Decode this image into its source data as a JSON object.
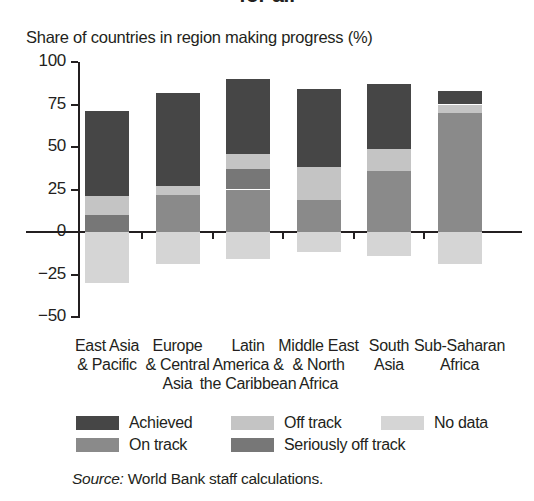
{
  "heading_clipped": "for all",
  "source": {
    "lead": "Source:",
    "text": " World Bank staff calculations."
  },
  "chart_data": {
    "type": "bar",
    "subtype": "stacked-bar-diverging",
    "title": "Share of countries in region making progress (%)",
    "ylabel": "Share of countries in region making progress (%)",
    "xlabel": "",
    "ylim": [
      -50,
      100
    ],
    "yticks": [
      100,
      75,
      50,
      25,
      0,
      -25,
      -50
    ],
    "ytick_labels": [
      "100",
      "75",
      "50",
      "25",
      "0",
      "−25",
      "−50"
    ],
    "grid": false,
    "legend_position": "bottom",
    "categories": [
      "East Asia & Pacific",
      "Europe & Central Asia",
      "Latin America & the Caribbean",
      "Middle East & North Africa",
      "South Asia",
      "Sub-Saharan Africa"
    ],
    "category_lines": [
      [
        "East Asia",
        "& Pacific"
      ],
      [
        "Europe",
        "& Central",
        "Asia"
      ],
      [
        "Latin",
        "America &",
        "the Caribbean"
      ],
      [
        "Middle East",
        "& North",
        "Africa"
      ],
      [
        "South",
        "Asia"
      ],
      [
        "Sub-Saharan",
        "Africa"
      ]
    ],
    "series": [
      {
        "name": "Achieved",
        "color": "#464646",
        "values": [
          50,
          55,
          44,
          46,
          38,
          8
        ]
      },
      {
        "name": "Off track",
        "color": "#c4c4c4",
        "values": [
          11,
          5,
          9,
          19,
          13,
          5
        ]
      },
      {
        "name": "Seriously off track",
        "color": "#777777",
        "values": [
          10,
          0,
          12,
          0,
          0,
          0
        ]
      },
      {
        "name": "On track",
        "color": "#8a8a8a",
        "values": [
          0,
          22,
          25,
          19,
          36,
          70
        ]
      },
      {
        "name": "No data",
        "color": "#d5d5d5",
        "values": [
          -30,
          -19,
          -16,
          -12,
          -14,
          -19
        ]
      }
    ],
    "totals_positive": [
      71,
      82,
      90,
      84,
      87,
      83
    ]
  },
  "legend": {
    "items": [
      {
        "label": "Achieved",
        "color": "#464646"
      },
      {
        "label": "On track",
        "color": "#8a8a8a"
      },
      {
        "label": "Off track",
        "color": "#c4c4c4"
      },
      {
        "label": "Seriously off track",
        "color": "#777777"
      },
      {
        "label": "No data",
        "color": "#d5d5d5"
      }
    ]
  }
}
